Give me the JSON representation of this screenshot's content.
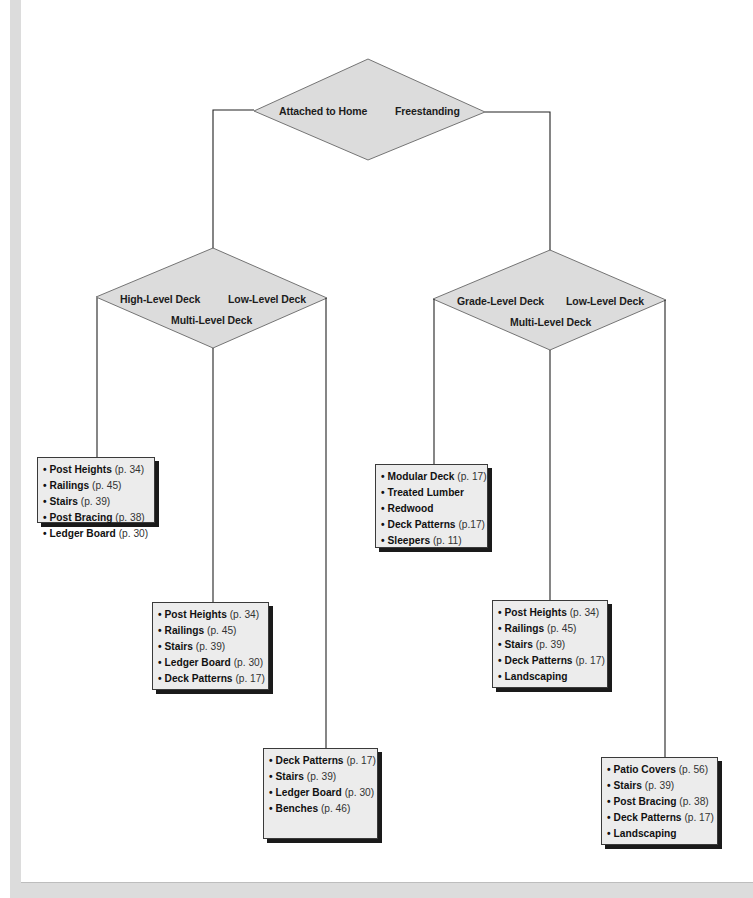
{
  "diagram": {
    "type": "decision-tree",
    "root": {
      "options": [
        "Attached to Home",
        "Freestanding"
      ]
    },
    "branches": {
      "attached": {
        "parent_option": "Attached to Home",
        "options": [
          "High-Level Deck",
          "Low-Level Deck",
          "Multi-Level Deck"
        ],
        "lists": [
          {
            "for": "High-Level Deck",
            "items": [
              {
                "name": "Post Heights",
                "page": "(p. 34)"
              },
              {
                "name": "Railings",
                "page": "(p. 45)"
              },
              {
                "name": "Stairs",
                "page": "(p. 39)"
              },
              {
                "name": "Post Bracing",
                "page": "(p. 38)"
              },
              {
                "name": "Ledger Board",
                "page": "(p. 30)"
              }
            ]
          },
          {
            "for": "Multi-Level Deck",
            "items": [
              {
                "name": "Post Heights",
                "page": "(p. 34)"
              },
              {
                "name": "Railings",
                "page": " (p. 45)"
              },
              {
                "name": "Stairs",
                "page": "  (p. 39)"
              },
              {
                "name": "Ledger Board",
                "page": "(p. 30)"
              },
              {
                "name": "Deck Patterns",
                "page": "(p. 17)"
              }
            ]
          },
          {
            "for": "Low-Level Deck",
            "items": [
              {
                "name": "Deck Patterns",
                "page": "(p. 17)"
              },
              {
                "name": "Stairs",
                "page": "(p. 39)"
              },
              {
                "name": "Ledger Board",
                "page": "(p. 30)"
              },
              {
                "name": "Benches",
                "page": "(p. 46)"
              }
            ]
          }
        ]
      },
      "freestanding": {
        "parent_option": "Freestanding",
        "options": [
          "Grade-Level Deck",
          "Low-Level Deck",
          "Multi-Level Deck"
        ],
        "lists": [
          {
            "for": "Grade-Level Deck",
            "items": [
              {
                "name": "Modular Deck",
                "page": "(p. 17)"
              },
              {
                "name": "Treated Lumber",
                "page": ""
              },
              {
                "name": "Redwood",
                "page": ""
              },
              {
                "name": "Deck Patterns",
                "page": "(p.17)"
              },
              {
                "name": "Sleepers",
                "page": "(p. 11)"
              }
            ]
          },
          {
            "for": "Multi-Level Deck",
            "items": [
              {
                "name": "Post Heights",
                "page": "(p. 34)"
              },
              {
                "name": "Railings",
                "page": "(p. 45)"
              },
              {
                "name": "Stairs",
                "page": " (p. 39)"
              },
              {
                "name": "Deck Patterns",
                "page": "(p. 17)"
              },
              {
                "name": "Landscaping",
                "page": ""
              }
            ]
          },
          {
            "for": "Low-Level Deck",
            "items": [
              {
                "name": "Patio Covers",
                "page": "(p. 56)"
              },
              {
                "name": "Stairs",
                "page": "(p. 39)"
              },
              {
                "name": "Post Bracing",
                "page": "(p. 38)"
              },
              {
                "name": "Deck Patterns",
                "page": "(p. 17)"
              },
              {
                "name": "Landscaping",
                "page": ""
              }
            ]
          }
        ]
      }
    },
    "bullet": "•",
    "colors": {
      "diamond_fill": "#dcdcdc",
      "box_fill": "#ececec",
      "line": "#333333",
      "shadow": "#1a1a1a",
      "page_edge": "#dcdcdc"
    }
  }
}
